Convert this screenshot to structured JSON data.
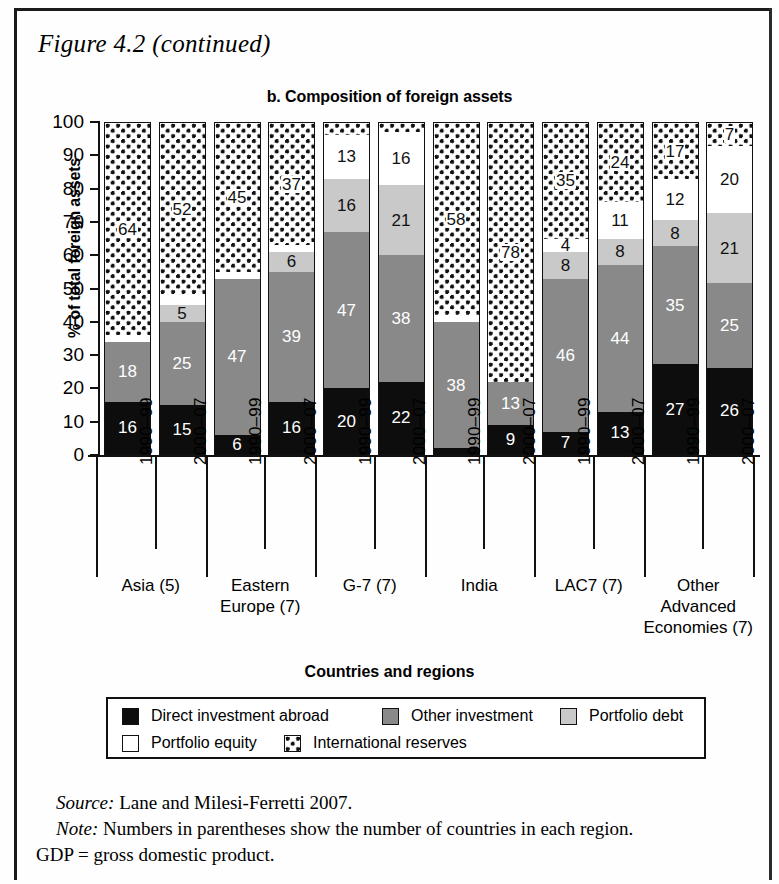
{
  "figure": {
    "caption": "Figure 4.2 (continued)",
    "panel_title": "b. Composition of foreign assets"
  },
  "axes": {
    "y_label": "% of total foreign assets",
    "x_label": "Countries and regions",
    "y_ticks": [
      "0",
      "10",
      "20",
      "30",
      "40",
      "50",
      "60",
      "70",
      "80",
      "90",
      "100"
    ]
  },
  "legend": {
    "items": [
      {
        "label": "Direct investment abroad",
        "key": "direct",
        "color": "#0d0d0d"
      },
      {
        "label": "Other investment",
        "key": "other",
        "color": "#898989"
      },
      {
        "label": "Portfolio debt",
        "key": "pdebt",
        "color": "#c9c9c9"
      },
      {
        "label": "Portfolio equity",
        "key": "pequity",
        "color": "#ffffff"
      },
      {
        "label": "International reserves",
        "key": "reserves",
        "color": "#ffffff"
      }
    ]
  },
  "notes": {
    "source_label": "Source:",
    "source_text": " Lane and Milesi-Ferretti 2007.",
    "note_label": "Note:",
    "note_text": " Numbers in parentheses show the number of countries in each region.",
    "abbrev_text": "GDP = gross domestic product."
  },
  "chart_data": {
    "type": "bar",
    "subtype": "stacked-100",
    "title": "b. Composition of foreign assets",
    "xlabel": "Countries and regions",
    "ylabel": "% of total foreign assets",
    "ylim": [
      0,
      100
    ],
    "ytick_step": 10,
    "grid": false,
    "legend_position": "bottom",
    "categories": [
      "Asia (5) 1990-99",
      "Asia (5) 2000-07",
      "Eastern Europe (7) 1990-99",
      "Eastern Europe (7) 2000-07",
      "G-7 (7) 1990-99",
      "G-7 (7) 2000-07",
      "India 1990-99",
      "India 2000-07",
      "LAC7 (7) 1990-99",
      "LAC7 (7) 2000-07",
      "Other Advanced Economies (7) 1990-99",
      "Other Advanced Economies (7) 2000-07"
    ],
    "series": [
      {
        "name": "Direct investment abroad",
        "values": [
          16,
          15,
          6,
          16,
          20,
          22,
          2,
          9,
          7,
          13,
          27,
          26
        ]
      },
      {
        "name": "Other investment",
        "values": [
          18,
          25,
          47,
          39,
          47,
          38,
          38,
          13,
          46,
          44,
          35,
          25
        ]
      },
      {
        "name": "Portfolio debt",
        "values": [
          0,
          5,
          0,
          6,
          16,
          21,
          0,
          0,
          8,
          8,
          8,
          21
        ]
      },
      {
        "name": "Portfolio equity",
        "values": [
          2,
          3,
          2,
          2,
          13,
          16,
          2,
          0,
          4,
          11,
          12,
          20
        ]
      },
      {
        "name": "International reserves",
        "values": [
          64,
          52,
          45,
          37,
          4,
          3,
          58,
          78,
          35,
          24,
          17,
          7
        ]
      }
    ],
    "groups": [
      {
        "name": "Asia (5)",
        "name_lines": [
          "Asia (5)"
        ],
        "bars": [
          {
            "period": "1990–99",
            "segments": [
              {
                "key": "direct",
                "value": 16,
                "label": "16"
              },
              {
                "key": "other",
                "value": 18,
                "label": "18"
              },
              {
                "key": "pequity",
                "value": 2,
                "label": ""
              },
              {
                "key": "reserves",
                "value": 64,
                "label": "64"
              }
            ]
          },
          {
            "period": "2000–07",
            "segments": [
              {
                "key": "direct",
                "value": 15,
                "label": "15"
              },
              {
                "key": "other",
                "value": 25,
                "label": "25"
              },
              {
                "key": "pdebt",
                "value": 5,
                "label": "5"
              },
              {
                "key": "pequity",
                "value": 3,
                "label": ""
              },
              {
                "key": "reserves",
                "value": 52,
                "label": "52"
              }
            ]
          }
        ]
      },
      {
        "name": "Eastern Europe (7)",
        "name_lines": [
          "Eastern",
          "Europe (7)"
        ],
        "bars": [
          {
            "period": "1990–99",
            "segments": [
              {
                "key": "direct",
                "value": 6,
                "label": "6"
              },
              {
                "key": "other",
                "value": 47,
                "label": "47"
              },
              {
                "key": "pequity",
                "value": 2,
                "label": ""
              },
              {
                "key": "reserves",
                "value": 45,
                "label": "45"
              }
            ]
          },
          {
            "period": "2000–07",
            "segments": [
              {
                "key": "direct",
                "value": 16,
                "label": "16"
              },
              {
                "key": "other",
                "value": 39,
                "label": "39"
              },
              {
                "key": "pdebt",
                "value": 6,
                "label": "6"
              },
              {
                "key": "pequity",
                "value": 2,
                "label": ""
              },
              {
                "key": "reserves",
                "value": 37,
                "label": "37"
              }
            ]
          }
        ]
      },
      {
        "name": "G-7 (7)",
        "name_lines": [
          "G-7 (7)"
        ],
        "bars": [
          {
            "period": "1990–99",
            "segments": [
              {
                "key": "direct",
                "value": 20,
                "label": "20"
              },
              {
                "key": "other",
                "value": 47,
                "label": "47"
              },
              {
                "key": "pdebt",
                "value": 16,
                "label": "16"
              },
              {
                "key": "pequity",
                "value": 13,
                "label": "13"
              },
              {
                "key": "reserves",
                "value": 4,
                "label": ""
              }
            ]
          },
          {
            "period": "2000–07",
            "segments": [
              {
                "key": "direct",
                "value": 22,
                "label": "22"
              },
              {
                "key": "other",
                "value": 38,
                "label": "38"
              },
              {
                "key": "pdebt",
                "value": 21,
                "label": "21"
              },
              {
                "key": "pequity",
                "value": 16,
                "label": "16"
              },
              {
                "key": "reserves",
                "value": 3,
                "label": ""
              }
            ]
          }
        ]
      },
      {
        "name": "India",
        "name_lines": [
          "India"
        ],
        "bars": [
          {
            "period": "1990–99",
            "segments": [
              {
                "key": "direct",
                "value": 2,
                "label": ""
              },
              {
                "key": "other",
                "value": 38,
                "label": "38"
              },
              {
                "key": "pequity",
                "value": 2,
                "label": ""
              },
              {
                "key": "reserves",
                "value": 58,
                "label": "58"
              }
            ]
          },
          {
            "period": "2000–07",
            "segments": [
              {
                "key": "direct",
                "value": 9,
                "label": "9"
              },
              {
                "key": "other",
                "value": 13,
                "label": "13"
              },
              {
                "key": "reserves",
                "value": 78,
                "label": "78"
              }
            ]
          }
        ]
      },
      {
        "name": "LAC7 (7)",
        "name_lines": [
          "LAC7 (7)"
        ],
        "bars": [
          {
            "period": "1990–99",
            "segments": [
              {
                "key": "direct",
                "value": 7,
                "label": "7"
              },
              {
                "key": "other",
                "value": 46,
                "label": "46"
              },
              {
                "key": "pdebt",
                "value": 8,
                "label": "8"
              },
              {
                "key": "pequity",
                "value": 4,
                "label": "4"
              },
              {
                "key": "reserves",
                "value": 35,
                "label": "35"
              }
            ]
          },
          {
            "period": "2000–07",
            "segments": [
              {
                "key": "direct",
                "value": 13,
                "label": "13"
              },
              {
                "key": "other",
                "value": 44,
                "label": "44"
              },
              {
                "key": "pdebt",
                "value": 8,
                "label": "8"
              },
              {
                "key": "pequity",
                "value": 11,
                "label": "11"
              },
              {
                "key": "reserves",
                "value": 24,
                "label": "24"
              }
            ]
          }
        ]
      },
      {
        "name": "Other Advanced Economies (7)",
        "name_lines": [
          "Other",
          "Advanced",
          "Economies (7)"
        ],
        "bars": [
          {
            "period": "1990–99",
            "segments": [
              {
                "key": "direct",
                "value": 27,
                "label": "27"
              },
              {
                "key": "other",
                "value": 35,
                "label": "35"
              },
              {
                "key": "pdebt",
                "value": 8,
                "label": "8"
              },
              {
                "key": "pequity",
                "value": 12,
                "label": "12"
              },
              {
                "key": "reserves",
                "value": 17,
                "label": "17"
              }
            ]
          },
          {
            "period": "2000–07",
            "segments": [
              {
                "key": "direct",
                "value": 26,
                "label": "26"
              },
              {
                "key": "other",
                "value": 25,
                "label": "25"
              },
              {
                "key": "pdebt",
                "value": 21,
                "label": "21"
              },
              {
                "key": "pequity",
                "value": 20,
                "label": "20"
              },
              {
                "key": "reserves",
                "value": 7,
                "label": "7"
              }
            ]
          }
        ]
      }
    ]
  }
}
